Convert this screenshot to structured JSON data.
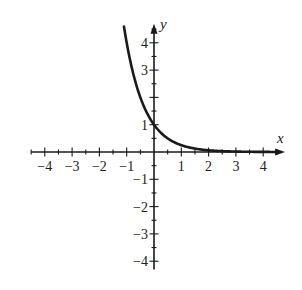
{
  "chart_data": {
    "type": "line",
    "title": "",
    "function": "y = (1/4)^x",
    "xlabel": "x",
    "ylabel": "y",
    "xlim": [
      -4.5,
      4.8
    ],
    "ylim": [
      -4.3,
      4.7
    ],
    "grid": false,
    "x_ticks": [
      -4,
      -3,
      -2,
      -1,
      1,
      2,
      3,
      4
    ],
    "x_tick_labels": [
      "−4",
      "−3",
      "−2",
      "−1",
      "1",
      "2",
      "3",
      "4"
    ],
    "y_ticks": [
      -4,
      -3,
      -2,
      -1,
      1,
      3,
      4
    ],
    "y_tick_labels": [
      "−4",
      "−3",
      "−2",
      "−1",
      "1",
      "3",
      "4"
    ],
    "minor_tick_step": 0.5,
    "series": [
      {
        "name": "curve",
        "x": [
          -1.1,
          -1.0,
          -0.75,
          -0.5,
          -0.25,
          0,
          0.25,
          0.5,
          0.75,
          1.0,
          1.5,
          2.0,
          2.5,
          3.0,
          3.5,
          4.0,
          4.5
        ],
        "y": [
          4.59,
          4.0,
          2.83,
          2.0,
          1.41,
          1.0,
          0.71,
          0.5,
          0.35,
          0.25,
          0.125,
          0.06,
          0.03,
          0.02,
          0.01,
          0.0,
          0.0
        ]
      }
    ],
    "color": "#1a1a1a"
  },
  "layout": {
    "origin_px": [
      154,
      152
    ],
    "unit_px": 27.3
  }
}
